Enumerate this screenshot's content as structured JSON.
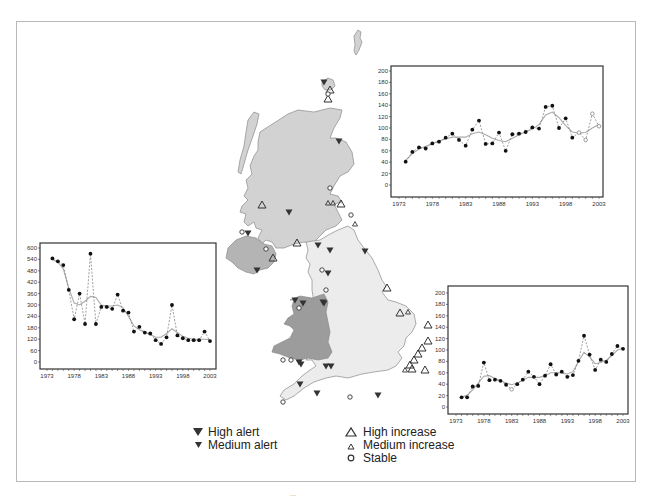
{
  "figure": {
    "map": {
      "regions": [
        {
          "name": "Scotland",
          "fill": "#d2d2d2"
        },
        {
          "name": "England",
          "fill": "#ececec"
        },
        {
          "name": "Wales",
          "fill": "#9c9c9c"
        },
        {
          "name": "Northern Ireland",
          "fill": "#b4b4b4"
        }
      ],
      "outline_color": "#8a8a8a"
    },
    "legend": {
      "items": [
        {
          "symbol": "filled-triangle-down-large",
          "label": "High alert"
        },
        {
          "symbol": "filled-triangle-down-small",
          "label": "Medium alert"
        },
        {
          "symbol": "open-triangle-up-large",
          "label": "High increase"
        },
        {
          "symbol": "open-triangle-up-small",
          "label": "Medium increase"
        },
        {
          "symbol": "open-circle",
          "label": "Stable"
        }
      ]
    }
  },
  "chart_data": [
    {
      "id": "top-right",
      "type": "line",
      "title": "",
      "xlabel": "",
      "ylabel": "",
      "ylim": [
        0,
        200
      ],
      "yticks": [
        0,
        20,
        40,
        60,
        80,
        100,
        120,
        140,
        160,
        180,
        200
      ],
      "xticks": [
        1973,
        1978,
        1983,
        1988,
        1993,
        1998,
        2003
      ],
      "x": [
        1974,
        1975,
        1976,
        1977,
        1978,
        1979,
        1980,
        1981,
        1982,
        1983,
        1984,
        1985,
        1986,
        1987,
        1988,
        1989,
        1990,
        1991,
        1992,
        1993,
        1994,
        1995,
        1996,
        1997,
        1998,
        1999,
        2000,
        2001,
        2002,
        2003
      ],
      "series": [
        {
          "name": "Annual index (points, dashed)",
          "values": [
            41,
            58,
            66,
            64,
            73,
            76,
            83,
            90,
            79,
            69,
            97,
            113,
            72,
            73,
            92,
            60,
            89,
            90,
            93,
            101,
            99,
            137,
            139,
            100,
            117,
            83,
            92,
            79,
            125,
            103
          ],
          "open_points_from_index": 26
        },
        {
          "name": "Smoothed trend",
          "values": [
            43,
            55,
            63,
            68,
            73,
            77,
            81,
            84,
            84,
            84,
            90,
            93,
            88,
            82,
            78,
            76,
            82,
            88,
            93,
            98,
            106,
            123,
            128,
            118,
            104,
            93,
            91,
            92,
            100,
            106
          ]
        }
      ],
      "grid": false,
      "legend": "none"
    },
    {
      "id": "left",
      "type": "line",
      "title": "",
      "xlabel": "",
      "ylabel": "",
      "ylim": [
        0,
        600
      ],
      "yticks": [
        0,
        60,
        120,
        180,
        240,
        300,
        360,
        420,
        480,
        540,
        600
      ],
      "xticks": [
        1973,
        1978,
        1983,
        1988,
        1993,
        1998,
        2003
      ],
      "x": [
        1974,
        1975,
        1976,
        1977,
        1978,
        1979,
        1980,
        1981,
        1982,
        1983,
        1984,
        1985,
        1986,
        1987,
        1988,
        1989,
        1990,
        1991,
        1992,
        1993,
        1994,
        1995,
        1996,
        1997,
        1998,
        1999,
        2000,
        2001,
        2002,
        2003
      ],
      "series": [
        {
          "name": "Annual index (points, dashed)",
          "values": [
            545,
            530,
            510,
            380,
            225,
            360,
            200,
            570,
            200,
            290,
            290,
            280,
            355,
            270,
            260,
            160,
            185,
            155,
            150,
            115,
            95,
            130,
            300,
            140,
            125,
            115,
            115,
            115,
            160,
            110
          ],
          "open_points_from_index": 99
        },
        {
          "name": "Smoothed trend",
          "values": [
            540,
            525,
            490,
            390,
            310,
            300,
            320,
            345,
            340,
            300,
            295,
            295,
            300,
            285,
            240,
            190,
            170,
            155,
            145,
            130,
            130,
            150,
            175,
            155,
            135,
            125,
            120,
            120,
            120,
            118
          ]
        }
      ],
      "grid": false,
      "legend": "none"
    },
    {
      "id": "bottom-right",
      "type": "line",
      "title": "",
      "xlabel": "",
      "ylabel": "",
      "ylim": [
        0,
        200
      ],
      "yticks": [
        0,
        20,
        40,
        60,
        80,
        100,
        120,
        140,
        160,
        180,
        200
      ],
      "xticks": [
        1973,
        1978,
        1983,
        1988,
        1993,
        1998,
        2003
      ],
      "x": [
        1974,
        1975,
        1976,
        1977,
        1978,
        1979,
        1980,
        1981,
        1982,
        1983,
        1984,
        1985,
        1986,
        1987,
        1988,
        1989,
        1990,
        1991,
        1992,
        1993,
        1994,
        1995,
        1996,
        1997,
        1998,
        1999,
        2000,
        2001,
        2002,
        2003
      ],
      "series": [
        {
          "name": "Annual index (points, dashed)",
          "values": [
            17,
            17,
            36,
            37,
            78,
            47,
            48,
            46,
            39,
            31,
            40,
            48,
            62,
            53,
            40,
            55,
            75,
            57,
            62,
            53,
            56,
            81,
            125,
            92,
            65,
            83,
            79,
            93,
            107,
            102
          ],
          "open_points_from_index": 99,
          "open_point_indices": [
            9
          ]
        },
        {
          "name": "Smoothed trend",
          "values": [
            17,
            21,
            30,
            42,
            54,
            55,
            50,
            46,
            42,
            39,
            42,
            47,
            52,
            52,
            52,
            55,
            60,
            60,
            60,
            58,
            62,
            80,
            96,
            88,
            76,
            78,
            82,
            90,
            100,
            103
          ]
        }
      ],
      "grid": false,
      "legend": "none"
    }
  ],
  "footer": {
    "caption_cutoff": "..."
  }
}
